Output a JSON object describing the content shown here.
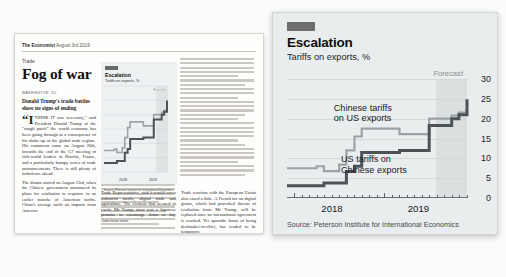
{
  "newspaper": {
    "masthead_brand": "The Economist",
    "masthead_date": "August 3rd 2019",
    "section_kicker": "Trade",
    "headline": "Fog of war",
    "dateline": "WASHINGTON, DC",
    "standfirst": "Donald Trump's trade battles show no signs of ending",
    "paragraph_1": "“I THINK IT was necessary,” said President Donald Trump of the “rough patch” the world economy has been going through as a consequence of his shake-up of the global trade regime. His comments came on August 26th, towards the end of the G7 meeting of rich-world leaders in Biarritz, France, and a particularly bumpy series of trade announcements. There is still plenty of turbulence ahead.",
    "paragraph_2": "The drama started on August 23rd, when the Chinese government announced its plans for retaliation in response to an earlier tranche of American tariffs. China's average tariff on imports from America",
    "paragraph_3": "Trade Representative, said it would cover industrial tariffs, digital trade and agriculture. The element that seemed to excite Mr Trump most was a Japanese promise to encourage firms to buy American corn.",
    "paragraph_4": "Trade tensions with the European Union also eased a little. A French tax on digital giants, which had provoked threats of retaliation from Mr Trump, will be replaced once an international agreement is reached. Yet sporadic bouts of being dealmaker-in-chief, has tended to be temporary."
  },
  "chart_card": {
    "accent_color": "#E3120B",
    "title": "Escalation",
    "subtitle": "Tariffs on exports, %",
    "forecast_label": "Forecast",
    "source": "Source: Peterson Institute for International Economics",
    "series_label_china": "Chinese tariffs\non US exports",
    "series_label_us": "US tariffs on\nChinese exports",
    "series_label_china_line1": "Chinese tariffs",
    "series_label_china_line2": "on US exports",
    "series_label_us_line1": "US tariffs on",
    "series_label_us_line2": "Chinese exports"
  },
  "chart_data": {
    "type": "line",
    "title": "Escalation",
    "subtitle": "Tariffs on exports, %",
    "xlabel": "",
    "ylabel": "Tariffs on exports, %",
    "ylim": [
      0,
      30
    ],
    "yticks": [
      0,
      5,
      10,
      15,
      20,
      25,
      30
    ],
    "xlim": [
      2017.92,
      2019.92
    ],
    "xticks": [
      2018,
      2019
    ],
    "xtick_labels": [
      "2018",
      "2019"
    ],
    "grid": true,
    "legend": "inline-annotations",
    "forecast_start_x": 2019.58,
    "forecast_note": "Shaded region to the right of 2019.58 is forecast",
    "series": [
      {
        "name": "Chinese tariffs on US exports",
        "color": "#9aa3a6",
        "step": "post",
        "x": [
          2017.92,
          2018.08,
          2018.25,
          2018.33,
          2018.42,
          2018.5,
          2018.58,
          2018.67,
          2018.75,
          2018.92,
          2019.17,
          2019.42,
          2019.5,
          2019.67,
          2019.75,
          2019.83,
          2019.92
        ],
        "values": [
          7.5,
          7.5,
          8.0,
          6.8,
          6.8,
          8.4,
          12.0,
          15.5,
          17.5,
          17.5,
          16.1,
          16.1,
          20.0,
          20.0,
          20.8,
          21.5,
          21.5
        ]
      },
      {
        "name": "US tariffs on Chinese exports",
        "color": "#4b5355",
        "step": "post",
        "x": [
          2017.92,
          2018.17,
          2018.33,
          2018.5,
          2018.58,
          2018.67,
          2018.75,
          2018.92,
          2019.17,
          2019.42,
          2019.5,
          2019.67,
          2019.75,
          2019.83,
          2019.92
        ],
        "values": [
          3.1,
          3.1,
          3.8,
          3.8,
          6.7,
          8.0,
          11.5,
          11.5,
          12.0,
          12.0,
          18.3,
          18.3,
          20.0,
          21.0,
          24.9
        ]
      }
    ],
    "source": "Source: Peterson Institute for International Economics"
  }
}
